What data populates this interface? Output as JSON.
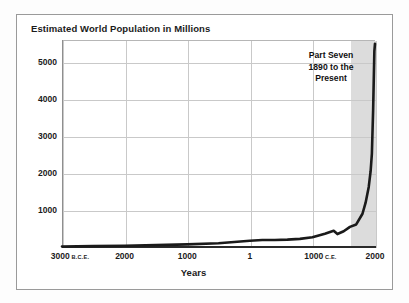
{
  "figure": {
    "title": "Estimated World Population in Millions",
    "xlabel": "Years",
    "annotation_lines": [
      "Part Seven",
      "1890 to the",
      "Present"
    ],
    "annotation_text": "Part Seven 1890 to the Present"
  },
  "chart_data": {
    "type": "line",
    "title": "Estimated World Population in Millions",
    "xlabel": "Years",
    "ylabel": "",
    "ylim": [
      0,
      5600
    ],
    "xlim": [
      -3000,
      2000
    ],
    "grid": true,
    "legend": null,
    "yticks": [
      1000,
      2000,
      3000,
      4000,
      5000
    ],
    "ytick_labels": [
      "1000",
      "2000",
      "3000",
      "4000",
      "5000"
    ],
    "xticks": [
      -3000,
      -2000,
      -1000,
      1,
      1000,
      2000
    ],
    "xtick_labels": [
      "3000",
      "2000",
      "1000",
      "1",
      "1000",
      "2000"
    ],
    "xtick_eras": [
      "B.C.E.",
      "",
      "",
      "",
      "C.E.",
      ""
    ],
    "shaded_region": {
      "label": "Part Seven 1890 to the Present",
      "x_start": 1600,
      "x_end": 2000,
      "color": "#dcdcdc"
    },
    "series": [
      {
        "name": "Estimated world population",
        "color": "#1a1a1a",
        "x": [
          -3000,
          -2500,
          -2000,
          -1500,
          -1000,
          -500,
          1,
          200,
          400,
          600,
          800,
          1000,
          1200,
          1340,
          1400,
          1500,
          1600,
          1700,
          1800,
          1850,
          1900,
          1930,
          1950,
          1970,
          1990,
          2000
        ],
        "y": [
          14,
          25,
          35,
          50,
          70,
          100,
          170,
          190,
          190,
          200,
          220,
          265,
          360,
          440,
          350,
          425,
          545,
          610,
          900,
          1200,
          1625,
          2050,
          2520,
          3700,
          5300,
          5500
        ]
      }
    ]
  }
}
